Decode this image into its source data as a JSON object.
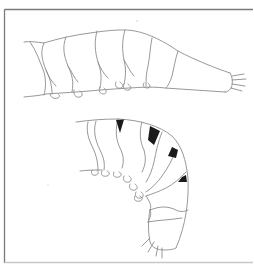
{
  "figure": {
    "type": "scientific line illustration",
    "views": [
      {
        "name": "lateral-straight",
        "segments": 7,
        "pigment_patches": 0
      },
      {
        "name": "lateral-curved",
        "segments": 8,
        "pigment_patches": 4
      }
    ],
    "colors": {
      "background": "#ffffff",
      "frame": "#7a7a7a",
      "outline": "#8c8c8c",
      "pigment": "#1a1a1a"
    }
  }
}
